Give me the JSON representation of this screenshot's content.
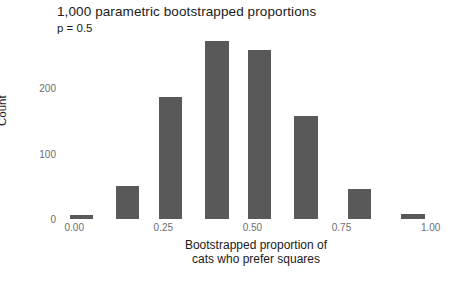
{
  "chart_data": {
    "type": "bar",
    "title": "1,000 parametric bootstrapped proportions",
    "subtitle": "p = 0.5",
    "xlabel_line1": "Bootstrapped proportion of",
    "xlabel_line2": "cats who prefer squares",
    "ylabel": "Count",
    "xlim": [
      -0.04,
      1.06
    ],
    "ylim": [
      0,
      280
    ],
    "grid": false,
    "legend": null,
    "bar_color": "#595959",
    "bar_width": 0.066,
    "xticks": [
      {
        "value": 0.0,
        "label": "0.00"
      },
      {
        "value": 0.25,
        "label": "0.25"
      },
      {
        "value": 0.5,
        "label": "0.50"
      },
      {
        "value": 0.75,
        "label": "0.75"
      },
      {
        "value": 1.0,
        "label": "1.00"
      }
    ],
    "yticks": [
      {
        "value": 0,
        "label": "0"
      },
      {
        "value": 100,
        "label": "100"
      },
      {
        "value": 200,
        "label": "200"
      }
    ],
    "x": [
      0.02,
      0.15,
      0.27,
      0.4,
      0.52,
      0.65,
      0.8,
      0.95
    ],
    "values": [
      6,
      50,
      186,
      272,
      258,
      157,
      46,
      8
    ],
    "bars": [
      {
        "x": 0.02,
        "value": 6
      },
      {
        "x": 0.15,
        "value": 50
      },
      {
        "x": 0.27,
        "value": 186
      },
      {
        "x": 0.4,
        "value": 272
      },
      {
        "x": 0.52,
        "value": 258
      },
      {
        "x": 0.65,
        "value": 157
      },
      {
        "x": 0.8,
        "value": 46
      },
      {
        "x": 0.95,
        "value": 8
      }
    ]
  }
}
